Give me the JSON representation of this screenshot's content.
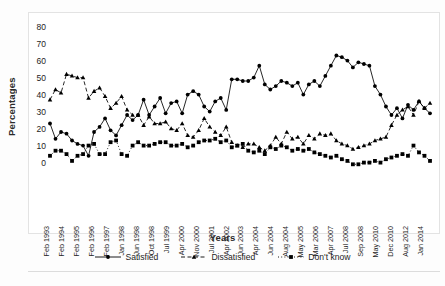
{
  "axes": {
    "ylabel": "Percentages",
    "xlabel": "Years",
    "yticks": [
      "0",
      "10",
      "20",
      "30",
      "40",
      "50",
      "60",
      "70",
      "80"
    ]
  },
  "legend": {
    "items": [
      {
        "label": "Satisfied",
        "marker": "circle",
        "line": "solid",
        "color": "#000000"
      },
      {
        "label": "Dissatisfied",
        "marker": "triangle",
        "line": "dashed",
        "color": "#000000"
      },
      {
        "label": "Don't know",
        "marker": "square",
        "line": "dotted",
        "color": "#000000"
      }
    ]
  },
  "chart_data": {
    "type": "line",
    "title": "",
    "xlabel": "Years",
    "ylabel": "Percentages",
    "ylim": [
      0,
      85
    ],
    "yticks": [
      0,
      10,
      20,
      30,
      40,
      50,
      60,
      70,
      80
    ],
    "grid": false,
    "legend_position": "bottom",
    "tick_labels": [
      "Feb 1993",
      "Feb 1994",
      "Feb 1995",
      "Feb 1996",
      "Feb 1997",
      "Jan 1998",
      "Jun 1998",
      "Oct 1998",
      "Jul 1999",
      "Apr 2000",
      "Nov 2000",
      "Jul 2001",
      "Apr 2002",
      "Jun 2003",
      "Apr 2004",
      "Jun 2004",
      "Aug 2004",
      "May 2005",
      "Mar 2006",
      "Apr 2007",
      "Jul 2008",
      "Sep 2008",
      "May 2010",
      "Dec 2010",
      "Aug 2012",
      "Jan 2014"
    ],
    "n_points": 70,
    "series": [
      {
        "name": "Satisfied",
        "marker": "circle",
        "line": "solid",
        "values": [
          35,
          26,
          30,
          29,
          25,
          23,
          22,
          16,
          30,
          33,
          38,
          31,
          28,
          34,
          40,
          37,
          40,
          49,
          40,
          45,
          50,
          41,
          47,
          48,
          41,
          52,
          54,
          52,
          45,
          42,
          48,
          50,
          43,
          61,
          61,
          60,
          60,
          62,
          69,
          58,
          55,
          57,
          60,
          59,
          57,
          59,
          52,
          58,
          60,
          57,
          63,
          69,
          75,
          74,
          72,
          68,
          71,
          70,
          69,
          57,
          52,
          45,
          40,
          44,
          38,
          46,
          43,
          48,
          44,
          41
        ]
      },
      {
        "name": "Dissatisfied",
        "marker": "triangle",
        "line": "dashed",
        "values": [
          49,
          55,
          53,
          64,
          63,
          62,
          62,
          50,
          54,
          56,
          51,
          44,
          47,
          51,
          43,
          40,
          40,
          34,
          39,
          35,
          35,
          36,
          32,
          31,
          35,
          28,
          27,
          31,
          38,
          33,
          30,
          28,
          33,
          24,
          22,
          21,
          23,
          23,
          21,
          19,
          22,
          27,
          23,
          30,
          26,
          27,
          23,
          28,
          26,
          29,
          28,
          29,
          25,
          23,
          22,
          20,
          21,
          22,
          23,
          25,
          26,
          27,
          34,
          40,
          43,
          45,
          40,
          48,
          44,
          47
        ]
      },
      {
        "name": "Don't know",
        "marker": "square",
        "line": "dotted",
        "values": [
          16,
          19,
          19,
          17,
          13,
          16,
          17,
          22,
          23,
          17,
          17,
          24,
          25,
          17,
          16,
          22,
          24,
          22,
          22,
          23,
          24,
          24,
          22,
          22,
          23,
          21,
          22,
          24,
          25,
          25,
          26,
          24,
          25,
          21,
          22,
          23,
          19,
          18,
          19,
          17,
          21,
          20,
          22,
          21,
          19,
          20,
          19,
          20,
          18,
          17,
          16,
          15,
          16,
          14,
          13,
          11,
          11,
          12,
          12,
          13,
          12,
          14,
          15,
          16,
          17,
          16,
          22,
          18,
          16,
          13
        ]
      }
    ]
  }
}
